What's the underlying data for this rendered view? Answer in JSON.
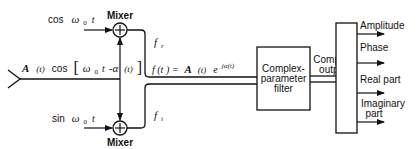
{
  "diagram": {
    "input_signal": {
      "amplitude": "A",
      "arg_t": "(t)",
      "cos": "cos",
      "omega": "ω",
      "sub0": "0",
      "t": "t",
      "minus_alpha": "-α",
      "alpha_arg": "(t)",
      "bracket_open": "[",
      "bracket_close": "]"
    },
    "mixer_top": {
      "label": "Mixer",
      "symbol": "+"
    },
    "mixer_bottom": {
      "label": "Mixer",
      "symbol": "+"
    },
    "oscillator_cos": {
      "func": "cos",
      "omega": "ω",
      "sub": "0",
      "t": "t"
    },
    "oscillator_sin": {
      "func": "sin",
      "omega": "ω",
      "sub": "0",
      "t": "t"
    },
    "branch_real": {
      "f": "f",
      "sub": "r"
    },
    "branch_imag": {
      "f": "f",
      "sub": "i"
    },
    "complex_signal": {
      "lhs": "f (t ) =",
      "A": "A",
      "At": "(t)",
      "e": "e",
      "exp": "jα(t)"
    },
    "filter": {
      "line1": "Complex-",
      "line2": "parameter",
      "line3": "filter"
    },
    "complex_output": {
      "line1": "Complex",
      "line2": "output"
    },
    "outputs": [
      {
        "label": "Amplitude"
      },
      {
        "label": "Phase"
      },
      {
        "label": "Real part"
      },
      {
        "label": "Imaginary",
        "label2": "part"
      }
    ],
    "colors": {
      "line": "#111111",
      "background": "#ffffff"
    }
  }
}
